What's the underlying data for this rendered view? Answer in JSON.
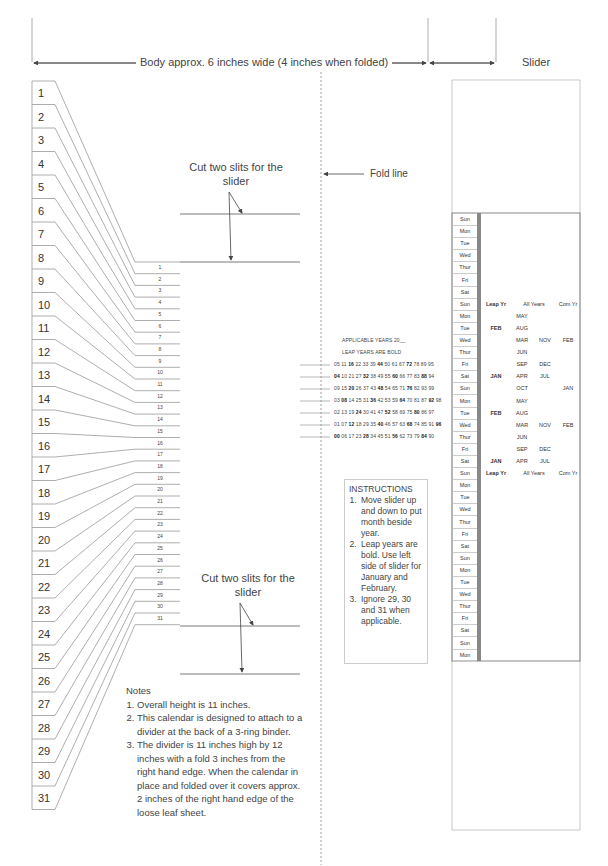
{
  "dimensions": {
    "body_label": "Body approx. 6 inches wide (4 inches when folded)",
    "slider_label": "Slider"
  },
  "tabs": [
    "1",
    "2",
    "3",
    "4",
    "5",
    "6",
    "7",
    "8",
    "9",
    "10",
    "11",
    "12",
    "13",
    "14",
    "15",
    "16",
    "17",
    "18",
    "19",
    "20",
    "21",
    "22",
    "23",
    "24",
    "25",
    "26",
    "27",
    "28",
    "29",
    "30",
    "31"
  ],
  "day_numbers": [
    "1",
    "2",
    "3",
    "4",
    "5",
    "6",
    "7",
    "8",
    "9",
    "10",
    "11",
    "12",
    "13",
    "14",
    "15",
    "16",
    "17",
    "18",
    "19",
    "20",
    "21",
    "22",
    "23",
    "24",
    "25",
    "26",
    "27",
    "28",
    "29",
    "30",
    "31"
  ],
  "cut_top": {
    "line1": "Cut two slits for the",
    "line2": "slider"
  },
  "cut_bottom": {
    "line1": "Cut two slits for the",
    "line2": "slider"
  },
  "fold_label": "Fold line",
  "years": {
    "title": "APPLICABLE YEARS 20__",
    "subtitle": "LEAP YEARS ARE BOLD",
    "rows": [
      [
        {
          "y": "05",
          "b": false
        },
        {
          "y": "11",
          "b": false
        },
        {
          "y": "16",
          "b": true
        },
        {
          "y": "22",
          "b": false
        },
        {
          "y": "33",
          "b": false
        },
        {
          "y": "39",
          "b": false
        },
        {
          "y": "44",
          "b": true
        },
        {
          "y": "50",
          "b": false
        },
        {
          "y": "61",
          "b": false
        },
        {
          "y": "67",
          "b": false
        },
        {
          "y": "72",
          "b": true
        },
        {
          "y": "78",
          "b": false
        },
        {
          "y": "89",
          "b": false
        },
        {
          "y": "95",
          "b": false
        }
      ],
      [
        {
          "y": "04",
          "b": true
        },
        {
          "y": "10",
          "b": false
        },
        {
          "y": "21",
          "b": false
        },
        {
          "y": "27",
          "b": false
        },
        {
          "y": "32",
          "b": true
        },
        {
          "y": "38",
          "b": false
        },
        {
          "y": "49",
          "b": false
        },
        {
          "y": "55",
          "b": false
        },
        {
          "y": "60",
          "b": true
        },
        {
          "y": "66",
          "b": false
        },
        {
          "y": "77",
          "b": false
        },
        {
          "y": "83",
          "b": false
        },
        {
          "y": "88",
          "b": true
        },
        {
          "y": "94",
          "b": false
        }
      ],
      [
        {
          "y": "09",
          "b": false
        },
        {
          "y": "15",
          "b": false
        },
        {
          "y": "20",
          "b": true
        },
        {
          "y": "26",
          "b": false
        },
        {
          "y": "37",
          "b": false
        },
        {
          "y": "43",
          "b": false
        },
        {
          "y": "48",
          "b": true
        },
        {
          "y": "54",
          "b": false
        },
        {
          "y": "65",
          "b": false
        },
        {
          "y": "71",
          "b": false
        },
        {
          "y": "76",
          "b": true
        },
        {
          "y": "82",
          "b": false
        },
        {
          "y": "93",
          "b": false
        },
        {
          "y": "99",
          "b": false
        }
      ],
      [
        {
          "y": "03",
          "b": false
        },
        {
          "y": "08",
          "b": true
        },
        {
          "y": "14",
          "b": false
        },
        {
          "y": "25",
          "b": false
        },
        {
          "y": "31",
          "b": false
        },
        {
          "y": "36",
          "b": true
        },
        {
          "y": "42",
          "b": false
        },
        {
          "y": "53",
          "b": false
        },
        {
          "y": "59",
          "b": false
        },
        {
          "y": "64",
          "b": true
        },
        {
          "y": "70",
          "b": false
        },
        {
          "y": "81",
          "b": false
        },
        {
          "y": "87",
          "b": false
        },
        {
          "y": "92",
          "b": true
        },
        {
          "y": "98",
          "b": false
        }
      ],
      [
        {
          "y": "02",
          "b": false
        },
        {
          "y": "13",
          "b": false
        },
        {
          "y": "19",
          "b": false
        },
        {
          "y": "24",
          "b": true
        },
        {
          "y": "30",
          "b": false
        },
        {
          "y": "41",
          "b": false
        },
        {
          "y": "47",
          "b": false
        },
        {
          "y": "52",
          "b": true
        },
        {
          "y": "58",
          "b": false
        },
        {
          "y": "69",
          "b": false
        },
        {
          "y": "75",
          "b": false
        },
        {
          "y": "80",
          "b": true
        },
        {
          "y": "86",
          "b": false
        },
        {
          "y": "97",
          "b": false
        }
      ],
      [
        {
          "y": "01",
          "b": false
        },
        {
          "y": "07",
          "b": false
        },
        {
          "y": "12",
          "b": true
        },
        {
          "y": "18",
          "b": false
        },
        {
          "y": "29",
          "b": false
        },
        {
          "y": "35",
          "b": false
        },
        {
          "y": "40",
          "b": true
        },
        {
          "y": "46",
          "b": false
        },
        {
          "y": "57",
          "b": false
        },
        {
          "y": "63",
          "b": false
        },
        {
          "y": "68",
          "b": true
        },
        {
          "y": "74",
          "b": false
        },
        {
          "y": "85",
          "b": false
        },
        {
          "y": "91",
          "b": false
        },
        {
          "y": "96",
          "b": true
        }
      ],
      [
        {
          "y": "00",
          "b": true
        },
        {
          "y": "06",
          "b": false
        },
        {
          "y": "17",
          "b": false
        },
        {
          "y": "23",
          "b": false
        },
        {
          "y": "28",
          "b": true
        },
        {
          "y": "34",
          "b": false
        },
        {
          "y": "45",
          "b": false
        },
        {
          "y": "51",
          "b": false
        },
        {
          "y": "56",
          "b": true
        },
        {
          "y": "62",
          "b": false
        },
        {
          "y": "73",
          "b": false
        },
        {
          "y": "79",
          "b": false
        },
        {
          "y": "84",
          "b": true
        },
        {
          "y": "90",
          "b": false
        }
      ]
    ]
  },
  "instructions": {
    "title": "INSTRUCTIONS",
    "items": [
      "Move slider up and down to put month beside year.",
      "Leap years are bold. Use left side of slider for January and February.",
      "Ignore 29, 30 and 31 when applicable."
    ]
  },
  "notes": {
    "title": "Notes",
    "items": [
      "Overall height is 11 inches.",
      "This calendar is designed to attach to a divider at the back of a 3-ring binder.",
      "The divider is 11 inches high by 12 inches with a fold 3 inches from the right hand edge. When the calendar in place and folded over it covers approx. 2 inches of the right hand edge of the loose leaf sheet."
    ]
  },
  "slider": {
    "days": [
      "Sun",
      "Mon",
      "Tue",
      "Wed",
      "Thur",
      "Fri",
      "Sat",
      "Sun",
      "Mon",
      "Tue",
      "Wed",
      "Thur",
      "Fri",
      "Sat",
      "Sun",
      "Mon",
      "Tue",
      "Wed",
      "Thur",
      "Fri",
      "Sat",
      "Sun",
      "Mon",
      "Tue",
      "Wed",
      "Thur",
      "Fri",
      "Sat",
      "Sun",
      "Mon",
      "Tue",
      "Wed",
      "Thur",
      "Fri",
      "Sat",
      "Sun",
      "Mon"
    ],
    "headers": {
      "leap": "Leap Yr",
      "all": "All Years",
      "com": "Com Yr"
    },
    "block": [
      {
        "leap": "",
        "a1": "MAY",
        "a2": "",
        "com": ""
      },
      {
        "leap": "FEB",
        "a1": "AUG",
        "a2": "",
        "com": ""
      },
      {
        "leap": "",
        "a1": "MAR",
        "a2": "NOV",
        "com": "FEB"
      },
      {
        "leap": "",
        "a1": "JUN",
        "a2": "",
        "com": ""
      },
      {
        "leap": "",
        "a1": "SEP",
        "a2": "DEC",
        "com": ""
      },
      {
        "leap": "JAN",
        "a1": "APR",
        "a2": "JUL",
        "com": ""
      },
      {
        "leap": "",
        "a1": "OCT",
        "a2": "",
        "com": "JAN"
      },
      {
        "leap": "",
        "a1": "MAY",
        "a2": "",
        "com": ""
      },
      {
        "leap": "FEB",
        "a1": "AUG",
        "a2": "",
        "com": ""
      },
      {
        "leap": "",
        "a1": "MAR",
        "a2": "NOV",
        "com": "FEB"
      },
      {
        "leap": "",
        "a1": "JUN",
        "a2": "",
        "com": ""
      },
      {
        "leap": "",
        "a1": "SEP",
        "a2": "DEC",
        "com": ""
      },
      {
        "leap": "JAN",
        "a1": "APR",
        "a2": "JUL",
        "com": ""
      }
    ]
  }
}
